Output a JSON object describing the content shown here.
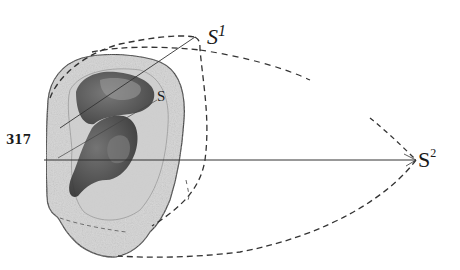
{
  "figure": {
    "number": "317",
    "labels": {
      "s": "S",
      "s1_base": "S",
      "s1_sup": "1",
      "s2_base": "S",
      "s2_sup": "2"
    },
    "colors": {
      "ink": "#1a1a1a",
      "ear_fill": "#d8d8d8",
      "concha_dark": "#4a4a4a",
      "background": "#ffffff"
    }
  }
}
